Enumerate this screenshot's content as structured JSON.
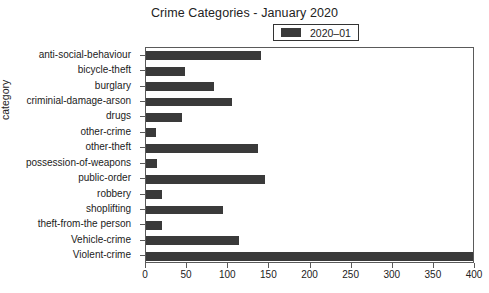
{
  "chart_data": {
    "type": "bar",
    "orientation": "horizontal",
    "title": "Crime Categories - January 2020",
    "xlabel": "",
    "ylabel": "category",
    "xlim": [
      0,
      400
    ],
    "ylim": null,
    "grid": false,
    "legend_position": "upper center",
    "bar_color": "#3a3a3a",
    "xticks": [
      0,
      50,
      100,
      150,
      200,
      250,
      300,
      350,
      400
    ],
    "xtick_labels": [
      "0",
      "50",
      "100",
      "150",
      "200",
      "250",
      "300",
      "350",
      "400"
    ],
    "categories": [
      "anti-social-behaviour",
      "bicycle-theft",
      "burglary",
      "criminial-damage-arson",
      "drugs",
      "other-crime",
      "other-theft",
      "possession-of-weapons",
      "public-order",
      "robbery",
      "shoplifting",
      "theft-from-the person",
      "Vehicle-crime",
      "Violent-crime"
    ],
    "series": [
      {
        "name": "2020–01",
        "values": [
          140,
          48,
          83,
          104,
          44,
          12,
          136,
          13,
          145,
          20,
          94,
          20,
          113,
          398
        ]
      }
    ]
  },
  "legend": {
    "entries": [
      {
        "label": "2020–01",
        "color": "#3a3a3a"
      }
    ]
  }
}
